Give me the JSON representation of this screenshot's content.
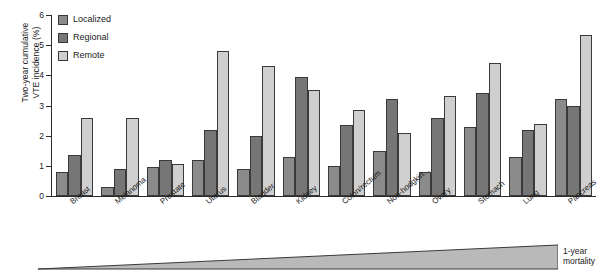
{
  "chart_data": {
    "type": "bar",
    "title": "",
    "xlabel": "",
    "ylabel": "Two-year cumulative\nVTE incidence (%)",
    "ylim": [
      0,
      6
    ],
    "yticks": [
      "0",
      "1",
      "2",
      "3",
      "4",
      "5",
      "6"
    ],
    "grid": false,
    "legend_position": "top-left",
    "categories": [
      "Breast",
      "Melanoma",
      "Prostate",
      "Uterus",
      "Bladder",
      "Kidney",
      "Colon/rectum",
      "Non-hodgkin...",
      "Ovary",
      "Stomach",
      "Lung",
      "Pancreas"
    ],
    "series": [
      {
        "name": "Localized",
        "color": "#8b8b8b",
        "values": [
          0.8,
          0.3,
          0.95,
          1.2,
          0.9,
          1.3,
          1.0,
          1.5,
          0.8,
          2.3,
          1.3,
          3.2
        ]
      },
      {
        "name": "Regional",
        "color": "#767676",
        "values": [
          1.35,
          0.9,
          1.2,
          2.2,
          2.0,
          3.95,
          2.35,
          3.2,
          2.6,
          3.4,
          2.2,
          3.0
        ]
      },
      {
        "name": "Remote",
        "color": "#cfcfcf",
        "values": [
          2.6,
          2.6,
          1.05,
          4.8,
          4.3,
          3.5,
          2.85,
          2.1,
          3.3,
          4.4,
          2.4,
          5.35
        ]
      }
    ],
    "annotation": {
      "wedge_label": "1-year\nmortality",
      "wedge_color": "#b9b9b9",
      "wedge_description": "increasing-gradient-triangle"
    }
  }
}
